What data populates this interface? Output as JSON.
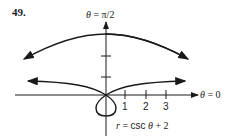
{
  "problem": {
    "number": "49."
  },
  "axes": {
    "top_label_theta": "θ",
    "top_label_eq": " = π/2",
    "right_label_theta": "θ",
    "right_label_eq": " = 0",
    "x_ticks": [
      "1",
      "2",
      "3"
    ]
  },
  "equation": {
    "r": "r",
    "eq": " = ",
    "fn": "csc",
    "theta": " θ",
    "rest": " + 2"
  },
  "colors": {
    "stroke": "#1a1a1a",
    "background": "#ffffff"
  }
}
